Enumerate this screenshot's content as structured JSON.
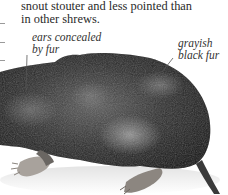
{
  "page": {
    "body_text_lines": [
      "snout stouter and less pointed than",
      "in other shrews."
    ]
  },
  "annotations": {
    "ears": {
      "lines": [
        "ears concealed",
        "by fur"
      ]
    },
    "fur": {
      "lines": [
        "grayish",
        "black fur"
      ]
    }
  },
  "illustration": {
    "subject": "shrew-photo",
    "colors": {
      "fur_dark": "#1c1c1c",
      "fur_mid": "#4a4a4a",
      "fur_light": "#9a9a9a",
      "feet": "#b8b0a8",
      "shadow": "#e6e6e6",
      "leader_line": "#555555"
    }
  }
}
